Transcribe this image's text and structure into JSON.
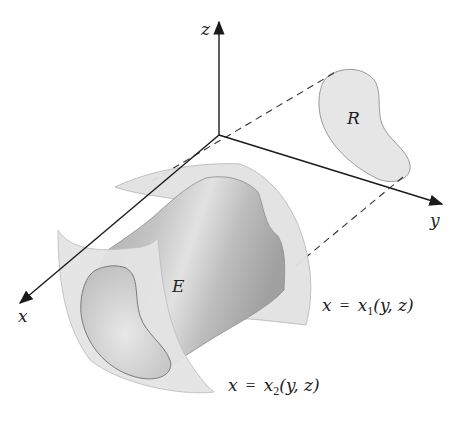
{
  "diagram": {
    "axes": {
      "z_label": "z",
      "y_label": "y",
      "x_label": "x"
    },
    "region_label": "R",
    "solid_label": "E",
    "surface_1": {
      "lhs": "x",
      "eq": "=",
      "fn": "x",
      "sub": "1",
      "args": "(y, z)"
    },
    "surface_2": {
      "lhs": "x",
      "eq": "=",
      "fn": "x",
      "sub": "2",
      "args": "(y, z)"
    },
    "colors": {
      "axis": "#1a1a1a",
      "region_fill": "#e6e6e6",
      "surface_fill": "#e4e4e4",
      "solid_dark": "#9a9a9a",
      "solid_light": "#d8d8d8",
      "outline": "#8c8c8c"
    }
  }
}
